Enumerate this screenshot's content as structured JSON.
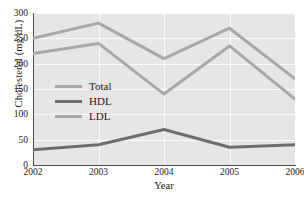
{
  "chart_data": {
    "type": "line",
    "title": "",
    "xlabel": "Year",
    "ylabel": "Cholesterol (mg/dL)",
    "categories": [
      "2002",
      "2003",
      "2004",
      "2005",
      "2006"
    ],
    "x": [
      2002,
      2003,
      2004,
      2005,
      2006
    ],
    "xlim": [
      2002,
      2006
    ],
    "ylim": [
      0,
      300
    ],
    "yticks": [
      0,
      50,
      100,
      150,
      200,
      250,
      300
    ],
    "xticks": [
      "2002",
      "2003",
      "2004",
      "2005",
      "2006"
    ],
    "grid": true,
    "grid_color": "#fbfbfb",
    "plot_background": "#e6e6e6",
    "legend_position": "center-left-inside",
    "series": [
      {
        "name": "Total",
        "values": [
          250,
          280,
          210,
          270,
          170
        ],
        "color": "#a8a8a8"
      },
      {
        "name": "HDL",
        "values": [
          30,
          40,
          70,
          35,
          40
        ],
        "color": "#6e6e6e"
      },
      {
        "name": "LDL",
        "values": [
          220,
          240,
          140,
          235,
          130
        ],
        "color": "#a8a8a8"
      }
    ]
  },
  "axes": {
    "y_title": "Cholesterol (mg/dL)",
    "x_title": "Year",
    "y_tick_labels": [
      "300",
      "250",
      "200",
      "150",
      "100",
      "50",
      "0"
    ],
    "x_tick_labels": [
      "2002",
      "2003",
      "2004",
      "2005",
      "2006"
    ]
  },
  "legend": {
    "items": [
      {
        "label": "Total",
        "color": "#a8a8a8"
      },
      {
        "label": "HDL",
        "color": "#6e6e6e"
      },
      {
        "label": "LDL",
        "color": "#a8a8a8"
      }
    ]
  }
}
